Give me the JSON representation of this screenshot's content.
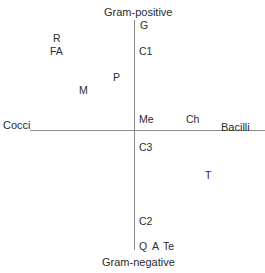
{
  "diagram": {
    "colors": {
      "axis": "#8c8c8c",
      "text": "#2b2b2b",
      "background": "#ffffff"
    },
    "axes": {
      "vertical": {
        "top_label": "Gram-positive",
        "bottom_label": "Gram-negative"
      },
      "horizontal": {
        "left_label": "Cocci",
        "right_label": "Bacilli"
      }
    },
    "points": [
      {
        "id": "G",
        "label": "G",
        "x": 140,
        "y": 20
      },
      {
        "id": "C1",
        "label": "C1",
        "x": 139,
        "y": 46
      },
      {
        "id": "R",
        "label": "R",
        "x": 53,
        "y": 33
      },
      {
        "id": "FA",
        "label": "FA",
        "x": 50,
        "y": 46
      },
      {
        "id": "P",
        "label": "P",
        "x": 113,
        "y": 72
      },
      {
        "id": "M",
        "label": "M",
        "x": 79,
        "y": 85
      },
      {
        "id": "Me",
        "label": "Me",
        "x": 139,
        "y": 114
      },
      {
        "id": "Ch",
        "label": "Ch",
        "x": 186,
        "y": 114
      },
      {
        "id": "C3",
        "label": "C3",
        "x": 139,
        "y": 142
      },
      {
        "id": "T",
        "label": "T",
        "x": 205,
        "y": 170
      },
      {
        "id": "C2",
        "label": "C2",
        "x": 139,
        "y": 216
      },
      {
        "id": "Q",
        "label": "Q",
        "x": 139,
        "y": 241
      },
      {
        "id": "A",
        "label": "A",
        "x": 152,
        "y": 241
      },
      {
        "id": "Te",
        "label": "Te",
        "x": 163,
        "y": 241
      }
    ]
  }
}
